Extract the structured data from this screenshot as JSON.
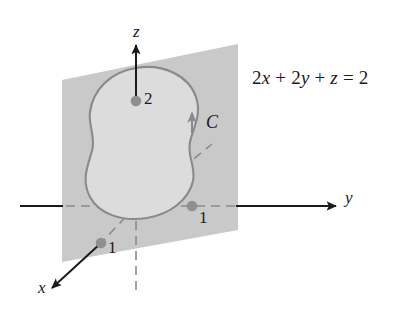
{
  "figure": {
    "plane_equation": {
      "full": "2x + 2y + z = 2",
      "parts": [
        "2",
        "x",
        " + ",
        "2",
        "y",
        " + ",
        "z",
        " = 2"
      ]
    },
    "axes": [
      {
        "name": "z-axis",
        "label": "z",
        "direction": "up"
      },
      {
        "name": "y-axis",
        "label": "y",
        "direction": "right"
      },
      {
        "name": "x-axis",
        "label": "x",
        "direction": "down-left"
      }
    ],
    "curve": {
      "label": "C",
      "orientation": "counterclockwise",
      "closed": true
    },
    "intercepts": [
      {
        "axis": "z",
        "label": "2",
        "value": 2
      },
      {
        "axis": "y",
        "label": "1",
        "value": 1
      },
      {
        "axis": "x",
        "label": "1",
        "value": 1
      }
    ],
    "colors": {
      "plane_fill": "#c9c9c9",
      "region_fill": "#dcdcdc",
      "curve_stroke": "#8a8a8a",
      "axis_stroke": "#1a1a1a",
      "dashed_stroke": "#8a8a8a",
      "dot_fill": "#8f8f8f",
      "text": "#1a1a1a",
      "background": "#ffffff"
    }
  }
}
